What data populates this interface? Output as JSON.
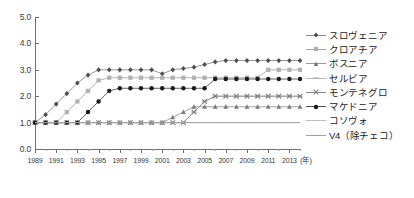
{
  "chart_data": {
    "type": "line",
    "title": "",
    "xlabel": "(年)",
    "ylabel": "",
    "x": [
      1989,
      1990,
      1991,
      1992,
      1993,
      1994,
      1995,
      1996,
      1997,
      1998,
      1999,
      2000,
      2001,
      2002,
      2003,
      2004,
      2005,
      2006,
      2007,
      2008,
      2009,
      2010,
      2011,
      2012,
      2013,
      2014
    ],
    "xlim": [
      1989,
      2014
    ],
    "ylim": [
      0.0,
      5.0
    ],
    "yticks": [
      "0.0",
      "1.0",
      "2.0",
      "3.0",
      "4.0",
      "5.0"
    ],
    "xticks": [
      "1989",
      "1991",
      "1993",
      "1995",
      "1997",
      "1999",
      "2001",
      "2003",
      "2005",
      "2007",
      "2009",
      "2011",
      "2013"
    ],
    "grid": false,
    "legend_position": "right",
    "series": [
      {
        "name": "スロヴェニア",
        "color": "#8c8c8c",
        "marker": "diamond",
        "marker_color": "#4d4d4d",
        "values": [
          1.0,
          1.3,
          1.7,
          2.1,
          2.5,
          2.8,
          3.0,
          3.0,
          3.0,
          3.0,
          3.0,
          3.0,
          2.85,
          3.0,
          3.05,
          3.1,
          3.2,
          3.3,
          3.35,
          3.35,
          3.35,
          3.35,
          3.35,
          3.35,
          3.35,
          3.35
        ]
      },
      {
        "name": "クロアチア",
        "color": "#aaaaaa",
        "marker": "square",
        "marker_color": "#b0b0b0",
        "values": [
          1.0,
          1.0,
          1.0,
          1.4,
          1.8,
          2.2,
          2.6,
          2.7,
          2.7,
          2.7,
          2.7,
          2.7,
          2.7,
          2.7,
          2.7,
          2.7,
          2.7,
          2.7,
          2.7,
          2.7,
          2.7,
          2.7,
          3.0,
          3.0,
          3.0,
          3.0
        ]
      },
      {
        "name": "ボスニア",
        "color": "#9a9a9a",
        "marker": "triangle",
        "marker_color": "#7a7a7a",
        "values": [
          1.0,
          1.0,
          1.0,
          1.0,
          1.0,
          1.0,
          1.0,
          1.0,
          1.0,
          1.0,
          1.0,
          1.0,
          1.0,
          1.2,
          1.4,
          1.6,
          1.6,
          1.6,
          1.6,
          1.6,
          1.6,
          1.6,
          1.6,
          1.6,
          1.6,
          1.6
        ]
      },
      {
        "name": "セルビア",
        "color": "#b4b4b4",
        "marker": "dash",
        "marker_color": "#b4b4b4",
        "values": [
          1.0,
          1.0,
          1.0,
          1.0,
          1.0,
          1.0,
          1.0,
          1.0,
          1.0,
          1.0,
          1.0,
          1.0,
          1.0,
          1.0,
          1.0,
          1.4,
          1.8,
          2.0,
          2.0,
          2.0,
          2.0,
          2.0,
          2.0,
          2.0,
          2.0,
          2.0
        ]
      },
      {
        "name": "モンテネグロ",
        "color": "#8f8f8f",
        "marker": "cross",
        "marker_color": "#7f7f7f",
        "values": [
          1.0,
          1.0,
          1.0,
          1.0,
          1.0,
          1.0,
          1.0,
          1.0,
          1.0,
          1.0,
          1.0,
          1.0,
          1.0,
          1.0,
          1.0,
          1.4,
          1.8,
          2.0,
          2.0,
          2.0,
          2.0,
          2.0,
          2.0,
          2.0,
          2.0,
          2.0
        ]
      },
      {
        "name": "マケドニア",
        "color": "#555555",
        "marker": "circle",
        "marker_color": "#1a1a1a",
        "values": [
          1.0,
          1.0,
          1.0,
          1.0,
          1.0,
          1.4,
          1.8,
          2.2,
          2.3,
          2.3,
          2.3,
          2.3,
          2.3,
          2.3,
          2.3,
          2.3,
          2.3,
          2.65,
          2.65,
          2.65,
          2.65,
          2.65,
          2.65,
          2.65,
          2.65,
          2.65
        ]
      },
      {
        "name": "コソヴォ",
        "color": "#bdbdbd",
        "marker": "none",
        "marker_color": "#bdbdbd",
        "values": [
          1.0,
          1.0,
          1.0,
          1.0,
          1.0,
          1.0,
          1.0,
          1.0,
          1.0,
          1.0,
          1.0,
          1.0,
          1.0,
          1.0,
          1.0,
          1.0,
          1.0,
          1.0,
          1.0,
          1.0,
          1.0,
          1.0,
          1.0,
          1.0,
          1.0,
          1.0
        ]
      },
      {
        "name": "V4（除チェコ）",
        "color": "#9e9e9e",
        "marker": "none",
        "marker_color": "#9e9e9e",
        "values": [
          1.0,
          1.0,
          1.0,
          1.0,
          1.0,
          1.0,
          1.0,
          1.0,
          1.0,
          1.0,
          1.0,
          1.0,
          1.0,
          1.0,
          1.0,
          1.0,
          1.0,
          1.0,
          1.0,
          1.0,
          1.0,
          1.0,
          1.0,
          1.0,
          1.0,
          1.0
        ]
      }
    ]
  }
}
